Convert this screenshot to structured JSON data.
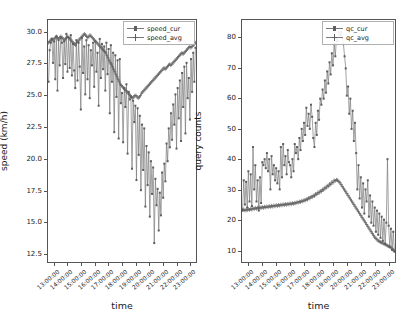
{
  "figure": {
    "width": 409,
    "height": 320,
    "background": "#ffffff",
    "line_color": "#7a7a7a",
    "marker_color": "#5e5e5e",
    "axis_color": "#555555"
  },
  "chart_data": [
    {
      "type": "line",
      "title": "",
      "xlabel": "time",
      "ylabel": "speed (km/h)",
      "grid": false,
      "legend_position": "upper right",
      "xtick_labels": [
        "13:00:00",
        "14:00:00",
        "15:00:00",
        "16:00:00",
        "17:00:00",
        "18:00:00",
        "19:00:00",
        "20:00:00",
        "21:00:00",
        "22:00:00",
        "23:00:00"
      ],
      "ytick_labels": [
        "12.5",
        "15.0",
        "17.5",
        "20.0",
        "22.5",
        "25.0",
        "27.5",
        "30.0"
      ],
      "ylim": [
        11.8,
        31.0
      ],
      "xlim": [
        0,
        132
      ],
      "series": [
        {
          "name": "speed_cur",
          "marker": "square",
          "values": [
            26.1,
            28.6,
            29.2,
            29.5,
            27.6,
            29.3,
            26.3,
            29.7,
            25.4,
            29.4,
            27.4,
            29.6,
            29.2,
            26.4,
            29.3,
            27.5,
            29.9,
            26.9,
            29.6,
            27.2,
            29.8,
            26.6,
            29.1,
            27.0,
            25.6,
            29.4,
            26.2,
            29.2,
            27.3,
            23.9,
            29.6,
            26.8,
            28.9,
            25.1,
            29.4,
            26.3,
            29.0,
            24.8,
            28.6,
            27.4,
            29.2,
            25.7,
            29.3,
            26.9,
            28.4,
            24.2,
            29.5,
            26.4,
            29.1,
            27.1,
            28.9,
            25.4,
            29.2,
            26.7,
            28.7,
            23.6,
            29.0,
            26.1,
            28.4,
            22.1,
            28.2,
            24.9,
            27.8,
            21.6,
            27.9,
            24.4,
            25.2,
            21.3,
            25.6,
            24.1,
            25.9,
            20.4,
            25.3,
            24.7,
            24.9,
            19.2,
            24.6,
            22.9,
            24.2,
            18.3,
            24.0,
            20.3,
            23.4,
            17.5,
            22.7,
            19.1,
            22.4,
            16.2,
            21.0,
            17.9,
            20.5,
            15.4,
            19.8,
            17.2,
            19.3,
            13.3,
            18.4,
            16.3,
            17.6,
            14.3,
            17.3,
            15.5,
            18.9,
            16.9,
            19.6,
            18.2,
            21.2,
            19.8,
            22.4,
            20.9,
            23.6,
            21.5,
            24.3,
            22.7,
            25.1,
            20.8,
            25.6,
            23.2,
            26.2,
            21.4,
            26.8,
            24.1,
            27.3,
            22.0,
            27.6,
            24.8,
            26.4,
            23.1,
            27.9,
            25.3,
            28.4,
            26.1,
            28.8
          ]
        },
        {
          "name": "speed_avg",
          "marker": "plus",
          "values": [
            29.2,
            29.3,
            29.4,
            29.5,
            29.4,
            29.5,
            29.6,
            29.7,
            29.6,
            29.5,
            29.6,
            29.7,
            29.6,
            29.5,
            29.4,
            29.5,
            29.6,
            29.7,
            29.6,
            29.5,
            29.4,
            29.3,
            29.2,
            29.1,
            29.0,
            29.2,
            29.3,
            29.4,
            29.5,
            29.6,
            29.7,
            29.8,
            29.9,
            29.8,
            29.7,
            29.6,
            29.7,
            29.8,
            29.7,
            29.6,
            29.5,
            29.4,
            29.3,
            29.2,
            29.1,
            29.0,
            28.9,
            28.8,
            28.7,
            28.6,
            28.5,
            28.4,
            28.2,
            28.0,
            27.8,
            27.6,
            27.5,
            27.3,
            27.1,
            26.9,
            26.7,
            26.5,
            26.3,
            26.1,
            25.9,
            25.8,
            25.7,
            25.6,
            25.5,
            25.4,
            25.3,
            25.2,
            25.1,
            25.0,
            24.9,
            24.8,
            24.9,
            25.0,
            25.0,
            24.9,
            24.8,
            24.9,
            25.0,
            25.2,
            25.3,
            25.4,
            25.5,
            25.6,
            25.7,
            25.8,
            25.9,
            26.0,
            26.1,
            26.2,
            26.3,
            26.4,
            26.5,
            26.6,
            26.7,
            26.8,
            26.9,
            27.0,
            27.1,
            27.2,
            27.1,
            27.2,
            27.3,
            27.4,
            27.5,
            27.4,
            27.5,
            27.6,
            27.7,
            27.8,
            27.9,
            28.0,
            28.1,
            28.2,
            28.3,
            28.4,
            28.3,
            28.4,
            28.5,
            28.6,
            28.7,
            28.8,
            28.9,
            28.8,
            28.9,
            29.0,
            29.1,
            29.2
          ]
        }
      ]
    },
    {
      "type": "line",
      "title": "",
      "xlabel": "time",
      "ylabel": "query counts",
      "grid": false,
      "legend_position": "upper right",
      "xtick_labels": [
        "13:00:00",
        "14:00:00",
        "15:00:00",
        "16:00:00",
        "17:00:00",
        "18:00:00",
        "19:00:00",
        "20:00:00",
        "21:00:00",
        "22:00:00",
        "23:00:00"
      ],
      "ytick_labels": [
        "10",
        "20",
        "30",
        "40",
        "50",
        "60",
        "70",
        "80"
      ],
      "ylim": [
        6,
        86
      ],
      "xlim": [
        0,
        132
      ],
      "series": [
        {
          "name": "qc_cur",
          "marker": "square",
          "values": [
            23.0,
            33.0,
            25.0,
            32.5,
            24.0,
            36.0,
            26.0,
            35.0,
            24.5,
            44.0,
            30.0,
            38.0,
            26.0,
            33.0,
            23.0,
            34.0,
            25.5,
            39.0,
            38.0,
            40.0,
            37.0,
            42.0,
            36.0,
            40.0,
            30.0,
            41.0,
            35.0,
            38.0,
            33.0,
            37.0,
            32.0,
            36.0,
            30.0,
            44.0,
            34.0,
            45.0,
            38.0,
            41.0,
            35.0,
            43.0,
            39.0,
            38.0,
            34.0,
            40.0,
            36.0,
            45.0,
            42.0,
            44.0,
            40.0,
            47.0,
            43.0,
            50.0,
            46.0,
            52.0,
            48.0,
            57.0,
            51.0,
            55.0,
            50.0,
            58.0,
            54.0,
            47.0,
            44.0,
            52.0,
            48.0,
            56.0,
            53.0,
            60.0,
            58.0,
            63.0,
            60.0,
            66.0,
            62.0,
            69.0,
            65.0,
            72.0,
            68.0,
            75.0,
            71.0,
            78.0,
            74.0,
            80.0,
            79.0,
            82.0,
            81.0,
            82.0,
            80.0,
            78.0,
            74.0,
            70.0,
            61.0,
            64.0,
            55.0,
            60.0,
            50.0,
            56.0,
            46.0,
            52.0,
            42.0,
            30.0,
            38.0,
            27.0,
            34.0,
            24.0,
            32.0,
            22.0,
            30.0,
            26.0,
            33.0,
            21.0,
            28.0,
            19.0,
            26.0,
            18.0,
            24.0,
            16.0,
            23.0,
            15.0,
            22.0,
            14.0,
            21.0,
            13.0,
            20.0,
            12.0,
            19.0,
            40.0,
            18.0,
            11.0,
            17.0,
            10.0,
            16.0,
            9.5
          ]
        },
        {
          "name": "qc_avg",
          "marker": "plus",
          "values": [
            23.2,
            23.4,
            23.0,
            23.3,
            23.1,
            23.5,
            23.2,
            23.6,
            23.3,
            23.8,
            23.5,
            23.9,
            23.6,
            24.0,
            23.7,
            24.1,
            23.8,
            24.2,
            23.9,
            24.3,
            24.0,
            24.4,
            24.1,
            24.5,
            24.2,
            24.6,
            24.3,
            24.7,
            24.4,
            24.8,
            24.5,
            24.9,
            24.6,
            25.0,
            24.7,
            25.1,
            24.8,
            25.2,
            24.9,
            25.3,
            25.0,
            25.4,
            25.1,
            25.5,
            25.2,
            25.6,
            25.4,
            25.8,
            25.6,
            26.0,
            25.8,
            26.2,
            26.0,
            26.5,
            26.3,
            26.8,
            26.6,
            27.2,
            27.0,
            27.6,
            27.4,
            28.0,
            27.8,
            28.5,
            28.3,
            29.0,
            28.8,
            29.5,
            29.3,
            30.0,
            29.8,
            30.6,
            30.4,
            31.2,
            31.0,
            31.8,
            31.6,
            32.4,
            32.2,
            33.0,
            32.8,
            33.2,
            33.0,
            32.6,
            32.2,
            31.6,
            31.0,
            30.4,
            29.8,
            29.2,
            28.6,
            28.0,
            27.4,
            26.8,
            26.2,
            25.6,
            25.0,
            24.4,
            23.8,
            23.2,
            22.6,
            22.0,
            21.4,
            20.8,
            20.2,
            19.6,
            19.0,
            18.4,
            17.8,
            17.2,
            16.6,
            16.0,
            15.4,
            14.8,
            14.2,
            13.8,
            13.4,
            13.0,
            12.8,
            12.6,
            12.4,
            12.2,
            12.0,
            11.8,
            11.6,
            11.4,
            11.2,
            11.0,
            10.8,
            10.4,
            10.0,
            9.6
          ]
        }
      ]
    }
  ]
}
